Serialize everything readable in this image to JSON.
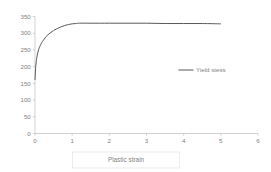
{
  "chart_data": {
    "type": "line",
    "title": "",
    "subtitle": "",
    "xlabel": "Plastic strain",
    "ylabel": "",
    "xlim": [
      0,
      6
    ],
    "ylim": [
      0,
      350
    ],
    "grid": false,
    "legend_position": "center-right",
    "x_ticks": [
      "0",
      "1",
      "2",
      "3",
      "4",
      "5",
      "6"
    ],
    "x_tick_values": [
      0,
      1,
      2,
      3,
      4,
      5,
      6
    ],
    "y_ticks": [
      "0",
      "50",
      "100",
      "150",
      "200",
      "250",
      "300",
      "350"
    ],
    "y_tick_values": [
      0,
      50,
      100,
      150,
      200,
      250,
      300,
      350
    ],
    "series": [
      {
        "name": "Yield stess",
        "color": "#595959",
        "x": [
          0,
          0.02,
          0.05,
          0.1,
          0.15,
          0.2,
          0.3,
          0.4,
          0.5,
          0.6,
          0.7,
          0.8,
          0.9,
          1.0,
          1.1,
          1.2,
          1.5,
          2.0,
          2.5,
          3.0,
          3.5,
          4.0,
          4.5,
          5.0
        ],
        "y": [
          160,
          200,
          228,
          252,
          265,
          275,
          290,
          300,
          308,
          314,
          319,
          323,
          326,
          328,
          329,
          330,
          330,
          330,
          330,
          330,
          329,
          329,
          329,
          328
        ]
      }
    ],
    "legend": [
      {
        "label": "Yield stess",
        "color": "#595959"
      }
    ],
    "colors": {
      "axis": "#bfbfbf",
      "text": "#7f7f7f",
      "series": "#595959",
      "background": "#ffffff",
      "title_box_border": "#e3e3e3"
    }
  }
}
